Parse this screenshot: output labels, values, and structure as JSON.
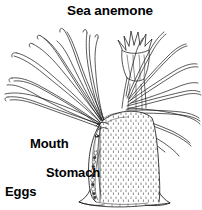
{
  "figure": {
    "kind": "scientific-line-illustration",
    "subject": "sea anemone",
    "title": "Sea anemone",
    "background_color": "#ffffff",
    "ink_color": "#000000",
    "width_px": 202,
    "height_px": 210
  },
  "labels": {
    "title": "Sea anemone",
    "mouth": "Mouth",
    "stomach": "Stomach",
    "eggs": "Eggs"
  },
  "anatomy_parts": [
    {
      "name": "tentacles",
      "description": "numerous long slender tapering tentacles radiating left and right from the oral disc, drawn as thin double-line strokes"
    },
    {
      "name": "oral-disc-polyp",
      "description": "small crown-like polyp with short pointed tentacles at the top centre-right"
    },
    {
      "name": "mouth",
      "description": "opening at the top of the body column leading into the stomach, shown in cutaway"
    },
    {
      "name": "stomach",
      "description": "central gastrovascular cavity inside the column, shown in cutaway"
    },
    {
      "name": "eggs",
      "description": "beaded chain of eggs along the mesentery in the lower left cutaway"
    },
    {
      "name": "body-column",
      "description": "tall tapering trunk, right half shaded with fine vertical stippling"
    },
    {
      "name": "pedal-disc",
      "description": "flared basal attachment disc at the bottom of the column"
    }
  ]
}
